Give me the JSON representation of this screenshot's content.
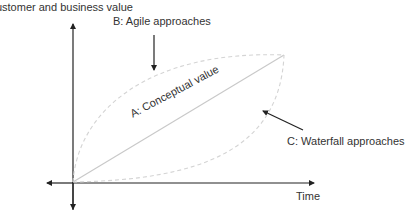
{
  "diagram": {
    "y_axis_label": "Customer and business value",
    "x_axis_label": "Time",
    "series": {
      "a": {
        "label": "A: Conceptual value",
        "style": "solid",
        "color": "#c8c8c8"
      },
      "b": {
        "label": "B: Agile approaches",
        "style": "dashed",
        "color": "#d0d0d0"
      },
      "c": {
        "label": "C: Waterfall approaches",
        "style": "dashed",
        "color": "#d0d0d0"
      }
    },
    "axis_color": "#222222",
    "arrow_color": "#222222"
  }
}
